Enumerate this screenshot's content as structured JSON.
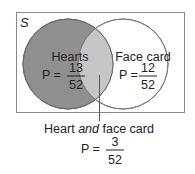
{
  "diagram": {
    "universe_label": "S",
    "colors": {
      "hearts_fill": "#8f8f8f",
      "intersection_fill": "#c4c4c4",
      "face_fill": "#ffffff",
      "stroke": "#555555",
      "frame": "#888888"
    },
    "sets": [
      {
        "name": "Hearts",
        "p_label": "P =",
        "numerator": "13",
        "denominator": "52"
      },
      {
        "name": "Face card",
        "p_label": "P =",
        "numerator": "12",
        "denominator": "52"
      }
    ],
    "intersection": {
      "label_pre": "Heart ",
      "label_italic": "and",
      "label_post": " face card",
      "p_label": "P =",
      "numerator": "3",
      "denominator": "52"
    }
  }
}
